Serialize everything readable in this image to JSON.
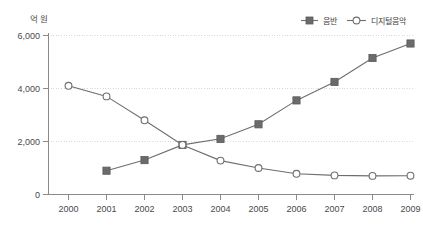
{
  "chart_data": {
    "type": "line",
    "title": "",
    "subtitle": "",
    "xlabel": "",
    "ylabel": "",
    "unit_label": "억 원",
    "categories": [
      "2000",
      "2001",
      "2002",
      "2003",
      "2004",
      "2005",
      "2006",
      "2007",
      "2008",
      "2009"
    ],
    "x": [
      2000,
      2001,
      2002,
      2003,
      2004,
      2005,
      2006,
      2007,
      2008,
      2009
    ],
    "ylim": [
      0,
      6000
    ],
    "yticks": [
      0,
      2000,
      4000,
      6000
    ],
    "ytick_labels": [
      "0",
      "2,000",
      "4,000",
      "6,000"
    ],
    "grid": true,
    "grid_axis": "y",
    "legend_position": "top-right",
    "series": [
      {
        "name": "음반",
        "marker": "filled-square",
        "color": "#6b6b6b",
        "values": [
          null,
          900,
          1300,
          1870,
          2100,
          2650,
          3550,
          4250,
          5150,
          5700
        ]
      },
      {
        "name": "디지털음악",
        "marker": "open-circle",
        "color": "#6e6e6e",
        "values": [
          4100,
          3700,
          2800,
          1870,
          1280,
          1000,
          780,
          720,
          700,
          710
        ]
      }
    ]
  },
  "colors": {
    "background": "#ffffff",
    "axis": "#8a8a8a",
    "grid": "#d9d9dd",
    "line": "#6e6e6e",
    "marker_fill": "#6b6b6b",
    "text": "#4a4a4a"
  },
  "legend": {
    "items": [
      {
        "label": "음반",
        "marker": "filled-square"
      },
      {
        "label": "디지털음악",
        "marker": "open-circle"
      }
    ]
  }
}
